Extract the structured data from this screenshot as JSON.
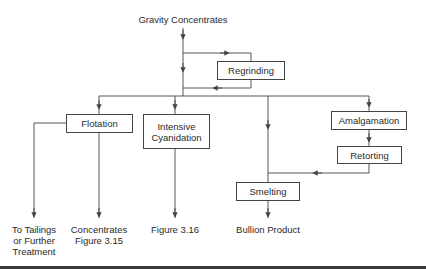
{
  "diagram": {
    "title": "Gravity Concentrates",
    "nodes": {
      "regrinding": "Regrinding",
      "flotation": "Flotation",
      "intensive_cyanidation": [
        "Intensive",
        "Cyanidation"
      ],
      "amalgamation": "Amalgamation",
      "retorting": "Retorting",
      "smelting": "Smelting"
    },
    "outputs": {
      "tailings": [
        "To Tailings",
        "or Further",
        "Treatment"
      ],
      "concentrates": [
        "Concentrates",
        "Figure 3.15"
      ],
      "cyanidation_ref": "Figure 3.16",
      "bullion": "Bullion Product"
    },
    "colors": {
      "line": "#444444",
      "text": "#2a2a2a",
      "rule": "#3a3a3a"
    }
  }
}
